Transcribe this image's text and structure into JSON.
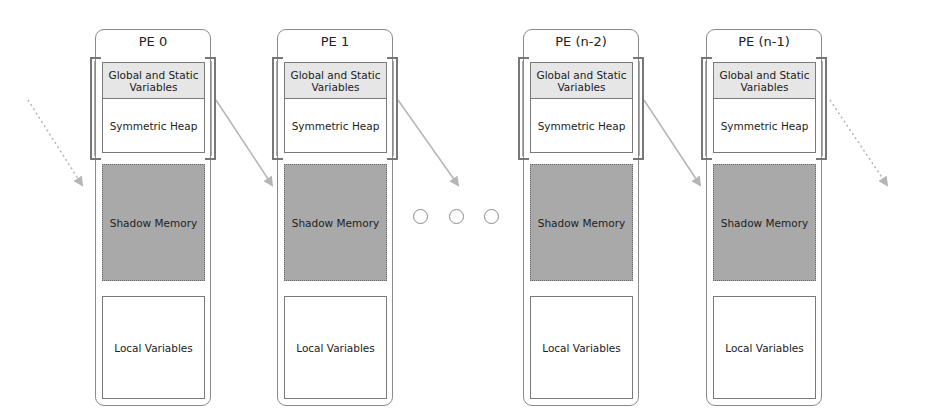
{
  "diagram": {
    "type": "memory-layout",
    "pes": [
      {
        "title": "PE 0",
        "left": 95
      },
      {
        "title": "PE 1",
        "left": 277
      },
      {
        "title": "PE (n-2)",
        "left": 523
      },
      {
        "title": "PE (n-1)",
        "left": 706
      }
    ],
    "segments": {
      "global": "Global and Static Variables",
      "heap": "Symmetric Heap",
      "shadow": "Shadow Memory",
      "local": "Local Variables"
    },
    "ellipsis": "○ ○ ○",
    "arrows": [
      {
        "style": "dotted",
        "from": [
          28,
          100
        ],
        "to": [
          82,
          185
        ]
      },
      {
        "style": "solid",
        "from": [
          216,
          100
        ],
        "to": [
          272,
          185
        ]
      },
      {
        "style": "solid",
        "from": [
          398,
          100
        ],
        "to": [
          458,
          185
        ]
      },
      {
        "style": "solid",
        "from": [
          644,
          100
        ],
        "to": [
          700,
          185
        ]
      },
      {
        "style": "dotted",
        "from": [
          830,
          100
        ],
        "to": [
          887,
          185
        ]
      }
    ],
    "colors": {
      "outline": "#8a8a8a",
      "global_fill": "#e6e6e6",
      "shadow_fill": "#a9a9a9",
      "arrow": "#b5b5b5"
    }
  }
}
